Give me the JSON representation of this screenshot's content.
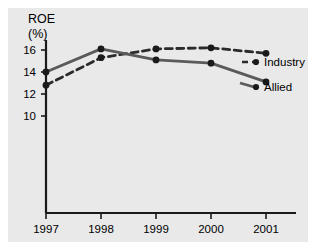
{
  "figure": {
    "background_color": "#e9e9e9",
    "page_color": "#ffffff",
    "axis_color": "#1a1a1a"
  },
  "axis": {
    "title": "ROE",
    "subtitle": "(%)",
    "y_ticks": [
      "16",
      "14",
      "12",
      "10"
    ],
    "x_ticks": [
      "1997",
      "1998",
      "1999",
      "2000",
      "2001"
    ]
  },
  "legend": {
    "industry_label": "Industry",
    "allied_label": "Allied"
  },
  "chart_data": {
    "type": "line",
    "title": "ROE (%)",
    "xlabel": "",
    "ylabel": "ROE (%)",
    "categories": [
      "1997",
      "1998",
      "1999",
      "2000",
      "2001"
    ],
    "ylim": [
      9,
      17
    ],
    "yticks": [
      10,
      12,
      14,
      16
    ],
    "grid": false,
    "legend_position": "right",
    "series": [
      {
        "name": "Industry",
        "values": [
          12.8,
          15.3,
          16.1,
          16.2,
          15.7
        ],
        "style": "dashed",
        "color": "#2b2b2b",
        "marker": "circle"
      },
      {
        "name": "Allied",
        "values": [
          14.0,
          16.1,
          15.1,
          14.8,
          13.1
        ],
        "style": "solid",
        "color": "#5a5a5a",
        "marker": "circle"
      }
    ]
  }
}
